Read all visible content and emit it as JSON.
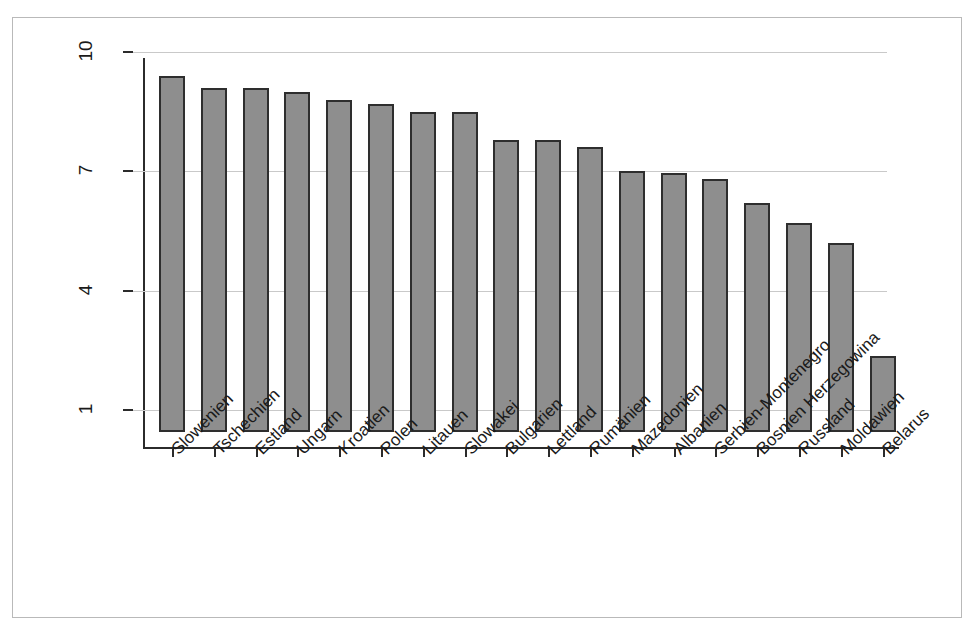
{
  "chart_data": {
    "type": "bar",
    "title": "",
    "subtitle": "",
    "xlabel": "",
    "ylabel": "",
    "ylim": [
      1,
      10
    ],
    "yticks": [
      1,
      4,
      7,
      10
    ],
    "ytick_labels": [
      "1",
      "4",
      "7",
      "10"
    ],
    "grid": "horizontal",
    "legend": "none",
    "orientation": "vertical",
    "bar_color": "#8e8e8e",
    "bar_edge_color": "#2e2e2e",
    "axis_color": "#2b2b2b",
    "gridline_color": "#c9c9c9",
    "background_color": "#ffffff",
    "frame_color": "#b9b9b9",
    "xlabel_rotation": -45,
    "ytick_rotation": -90,
    "categories": [
      "Slowenien",
      "Tschechien",
      "Estland",
      "Ungarn",
      "Kroatien",
      "Polen",
      "Litauen",
      "Slowakei",
      "Bulgarien",
      "Lettland",
      "Rumänien",
      "Mazedonien",
      "Albanien",
      "Serbien-Montenegro",
      "Bosnien Herzegowina",
      "Russland",
      "Moldawien",
      "Belarus"
    ],
    "values": [
      9.4,
      9.1,
      9.1,
      9.0,
      8.8,
      8.7,
      8.5,
      8.5,
      7.8,
      7.8,
      7.6,
      7.0,
      6.95,
      6.8,
      6.2,
      5.7,
      5.2,
      2.35
    ]
  }
}
